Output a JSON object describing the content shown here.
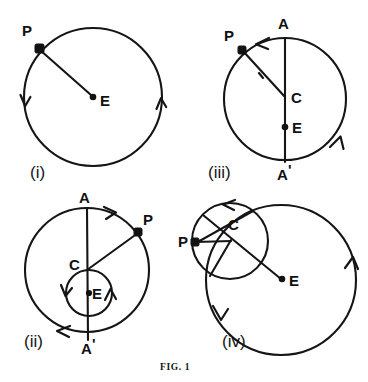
{
  "figure": {
    "caption": "FIG. 1",
    "stroke_color": "#151515",
    "background_color": "#ffffff",
    "panels": [
      {
        "id": "i",
        "label": "(i)",
        "description": "Circle with centre E and point P on the circumference joined to E by a radius; two arrowheads indicate counter-clockwise motion.",
        "points": [
          {
            "name": "P",
            "label": "P",
            "marker": "square",
            "x": 38,
            "y": 47
          },
          {
            "name": "E",
            "label": "E",
            "marker": "dot",
            "x": 93,
            "y": 97
          }
        ],
        "circles": [
          {
            "name": "main-circle",
            "cx": 93,
            "cy": 97,
            "r": 69
          }
        ],
        "segments": [
          {
            "name": "radius-P-E",
            "from": "P",
            "to": "E"
          }
        ],
        "arrows": [
          {
            "name": "arrow-left",
            "direction": "down"
          },
          {
            "name": "arrow-right",
            "direction": "up"
          }
        ]
      },
      {
        "id": "iii",
        "label": "(iii)",
        "description": "Circle with vertical diameter A to A', centre C, focus point E below C, and point P on the circumference joined to C.",
        "points": [
          {
            "name": "A",
            "label": "A",
            "marker": "none",
            "x": 284,
            "y": 22
          },
          {
            "name": "P",
            "label": "P",
            "marker": "square",
            "x": 240,
            "y": 47
          },
          {
            "name": "C",
            "label": "C",
            "marker": "none",
            "x": 286,
            "y": 97
          },
          {
            "name": "E",
            "label": "E",
            "marker": "dot",
            "x": 284,
            "y": 127
          },
          {
            "name": "Aprime",
            "label": "A",
            "prime": "'",
            "marker": "none",
            "x": 284,
            "y": 175
          }
        ],
        "circles": [
          {
            "name": "main-circle",
            "cx": 285,
            "cy": 99,
            "r": 61
          }
        ],
        "segments": [
          {
            "name": "diameter-A-Aprime",
            "from": "A",
            "to": "Aprime"
          },
          {
            "name": "radius-C-P",
            "from": "C",
            "to": "P"
          }
        ],
        "arrows": [
          {
            "name": "arrow-top",
            "direction": "left"
          },
          {
            "name": "arrow-lower-right",
            "direction": "up"
          },
          {
            "name": "arrow-on-radius",
            "direction": "toward-P"
          }
        ]
      },
      {
        "id": "ii",
        "label": "(ii)",
        "description": "Large circle with vertical diameter A to A' and centre C; a small circle centred on E lies below C, C being on the small circle. Radius C to P drawn to the large circle.",
        "points": [
          {
            "name": "A",
            "label": "A",
            "marker": "none",
            "x": 84,
            "y": 196
          },
          {
            "name": "P",
            "label": "P",
            "marker": "square",
            "x": 137,
            "y": 231
          },
          {
            "name": "C",
            "label": "C",
            "marker": "none",
            "x": 87,
            "y": 270
          },
          {
            "name": "E",
            "label": "E",
            "marker": "dot",
            "x": 89,
            "y": 293
          },
          {
            "name": "Aprime",
            "label": "A",
            "prime": "'",
            "marker": "none",
            "x": 88,
            "y": 348
          }
        ],
        "circles": [
          {
            "name": "outer-circle",
            "cx": 87,
            "cy": 270,
            "r": 62
          },
          {
            "name": "inner-circle",
            "cx": 89,
            "cy": 293,
            "r": 23
          }
        ],
        "segments": [
          {
            "name": "diameter-A-Aprime",
            "from": "A",
            "to": "Aprime"
          },
          {
            "name": "radius-C-P",
            "from": "C",
            "to": "P"
          }
        ],
        "arrows": [
          {
            "name": "arrow-outer-top",
            "direction": "right"
          },
          {
            "name": "arrow-outer-lower-left",
            "direction": "left"
          },
          {
            "name": "arrow-inner-left",
            "direction": "down"
          },
          {
            "name": "arrow-inner-right",
            "direction": "up"
          }
        ]
      },
      {
        "id": "iv",
        "label": "(iv)",
        "description": "Two overlapping circles: a large circle containing point E and a smaller circle centred at C passing through P, with a line from the small circle through C down to E.",
        "points": [
          {
            "name": "P",
            "label": "P",
            "marker": "square",
            "x": 194,
            "y": 242
          },
          {
            "name": "C",
            "label": "C",
            "marker": "none",
            "x": 231,
            "y": 228
          },
          {
            "name": "E",
            "label": "E",
            "marker": "dot",
            "x": 283,
            "y": 280
          }
        ],
        "circles": [
          {
            "name": "large-circle",
            "cx": 281,
            "cy": 280,
            "r": 75
          },
          {
            "name": "small-circle",
            "cx": 230,
            "cy": 241,
            "r": 38
          }
        ],
        "segments": [
          {
            "name": "radius-C-P",
            "from": "C",
            "to": "P"
          },
          {
            "name": "chord-through-C-to-E",
            "from": "small-circle-upper-left",
            "to": "E"
          },
          {
            "name": "chord-P-upper-right",
            "from": "P",
            "to": "small-circle-upper-right"
          }
        ],
        "arrows": [
          {
            "name": "arrow-small-circle-top",
            "direction": "left"
          },
          {
            "name": "arrow-large-circle-right",
            "direction": "up"
          },
          {
            "name": "arrow-large-circle-lower-left",
            "direction": "down"
          }
        ]
      }
    ]
  }
}
